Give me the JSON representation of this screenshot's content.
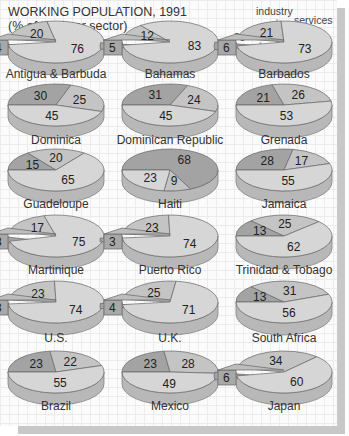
{
  "chart_data": {
    "type": "pie",
    "title": "WORKING POPULATION, 1991",
    "subtitle": "(% of total per sector)",
    "legend": [
      "agriculture",
      "industry",
      "services"
    ],
    "colors": {
      "agriculture": "#a3a3a3",
      "industry": "#c4c4c4",
      "services": "#d6d6d6",
      "side": "#b8b8b8"
    },
    "charts": [
      {
        "name": "Antigua & Barbuda",
        "agriculture": 4,
        "industry": 20,
        "services": 76,
        "exploded": true
      },
      {
        "name": "Bahamas",
        "agriculture": 5,
        "industry": 12,
        "services": 83,
        "exploded": true
      },
      {
        "name": "Barbados",
        "agriculture": 6,
        "industry": 21,
        "services": 73,
        "exploded": true
      },
      {
        "name": "Dominica",
        "agriculture": 30,
        "industry": 25,
        "services": 45,
        "exploded": false
      },
      {
        "name": "Dominican Republic",
        "agriculture": 31,
        "industry": 24,
        "services": 45,
        "exploded": false
      },
      {
        "name": "Grenada",
        "agriculture": 21,
        "industry": 26,
        "services": 53,
        "exploded": false
      },
      {
        "name": "Guadeloupe",
        "agriculture": 15,
        "industry": 20,
        "services": 65,
        "exploded": false
      },
      {
        "name": "Haiti",
        "agriculture": 68,
        "industry": 9,
        "services": 23,
        "exploded": false
      },
      {
        "name": "Jamaica",
        "agriculture": 28,
        "industry": 17,
        "services": 55,
        "exploded": false
      },
      {
        "name": "Martinique",
        "agriculture": 8,
        "industry": 17,
        "services": 75,
        "exploded": true
      },
      {
        "name": "Puerto Rico",
        "agriculture": 3,
        "industry": 23,
        "services": 74,
        "exploded": true
      },
      {
        "name": "Trinidad & Tobago",
        "agriculture": 13,
        "industry": 25,
        "services": 62,
        "exploded": false
      },
      {
        "name": "U.S.",
        "agriculture": 3,
        "industry": 23,
        "services": 74,
        "exploded": true
      },
      {
        "name": "U.K.",
        "agriculture": 4,
        "industry": 25,
        "services": 71,
        "exploded": true
      },
      {
        "name": "South Africa",
        "agriculture": 13,
        "industry": 31,
        "services": 56,
        "exploded": false
      },
      {
        "name": "Brazil",
        "agriculture": 23,
        "industry": 22,
        "services": 55,
        "exploded": false
      },
      {
        "name": "Mexico",
        "agriculture": 23,
        "industry": 28,
        "services": 49,
        "exploded": false
      },
      {
        "name": "Japan",
        "agriculture": 6,
        "industry": 34,
        "services": 60,
        "exploded": true
      }
    ],
    "layout": {
      "columns": 3,
      "rows": 6
    }
  }
}
